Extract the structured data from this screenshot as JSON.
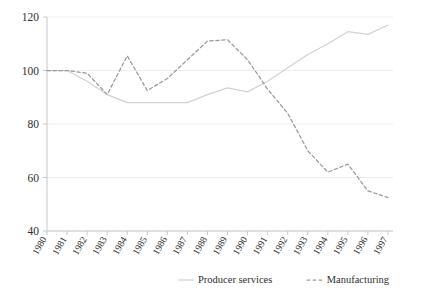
{
  "chart_data": {
    "type": "line",
    "title": "",
    "subtitle": "",
    "xlabel": "",
    "ylabel": "",
    "grid": "horizontal-gridlines-at-y-ticks",
    "legend_position": "bottom-center",
    "xlim": [
      1980,
      1997
    ],
    "ylim": [
      40,
      120
    ],
    "ytick_values": [
      120,
      100,
      80,
      60,
      40
    ],
    "ytick_labels": [
      "120",
      "100",
      "80",
      "60",
      "40"
    ],
    "categories": [
      "1980",
      "1981",
      "1982",
      "1983",
      "1984",
      "1985",
      "1986",
      "1987",
      "1988",
      "1989",
      "1990",
      "1991",
      "1992",
      "1993",
      "1994",
      "1995",
      "1996",
      "1997"
    ],
    "series": [
      {
        "name": "Producer services",
        "style": "solid",
        "color": "#d2d2d2",
        "values": [
          100,
          100,
          96,
          91,
          88,
          88,
          88,
          88,
          91,
          93.5,
          92,
          96,
          101,
          106,
          110,
          114.5,
          113.5,
          117
        ]
      },
      {
        "name": "Manufacturing",
        "style": "dashed",
        "color": "#9a9a9a",
        "values": [
          100,
          100,
          99,
          91,
          105.5,
          92.5,
          97,
          104,
          111,
          111.5,
          104,
          93,
          84,
          70,
          62,
          65,
          55,
          52.5
        ]
      }
    ]
  },
  "legend": {
    "items": [
      {
        "label": "Producer services",
        "style": "solid"
      },
      {
        "label": "Manufacturing",
        "style": "dashed"
      }
    ]
  },
  "colors": {
    "axis": "#c8c8c8",
    "gridline": "#ededed",
    "tick_text": "#2f2f2f",
    "series_solid": "#d2d2d2",
    "series_dashed": "#9a9a9a",
    "background": "#ffffff"
  }
}
